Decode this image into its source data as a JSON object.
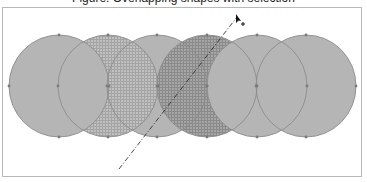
{
  "title": {
    "text": "Figure: Overlapping shapes with selection",
    "note": "title text is clipped at top edge; only descenders visible"
  },
  "canvas": {
    "frame": {
      "x": 2,
      "y": 7,
      "width": 360,
      "height": 170,
      "border_color": "#b8b8b8"
    },
    "colors": {
      "fill_plain": "#b5b5b5",
      "outline": "#8c8c8c",
      "handle": "#7a7a7a",
      "checker_light_a": "#c2c2c2",
      "checker_light_b": "#a6a6a6",
      "checker_dark_a": "#aaaaaa",
      "checker_dark_b": "#8e8e8e",
      "line": "#333333"
    },
    "circles": [
      {
        "id": "circle-1",
        "cx": 59,
        "cy": 86,
        "rx": 50,
        "ry": 51,
        "fill": "plain"
      },
      {
        "id": "circle-2",
        "cx": 108,
        "cy": 86,
        "rx": 50,
        "ry": 51,
        "fill": "checker-light"
      },
      {
        "id": "circle-3",
        "cx": 157,
        "cy": 86,
        "rx": 50,
        "ry": 51,
        "fill": "plain"
      },
      {
        "id": "circle-4",
        "cx": 207,
        "cy": 86,
        "rx": 50,
        "ry": 51,
        "fill": "checker-dark"
      },
      {
        "id": "circle-5",
        "cx": 257,
        "cy": 86,
        "rx": 50,
        "ry": 51,
        "fill": "plain"
      },
      {
        "id": "circle-6",
        "cx": 306,
        "cy": 86,
        "rx": 50,
        "ry": 51,
        "fill": "plain"
      }
    ],
    "draw_order": [
      "circle-3",
      "circle-2",
      "circle-4",
      "circle-1",
      "circle-5",
      "circle-6"
    ],
    "dash_line": {
      "x1": 119,
      "y1": 169,
      "x2": 237,
      "y2": 17,
      "style": "dash-dot"
    },
    "cursor": {
      "x": 237,
      "y": 15,
      "type": "arrow-with-plus"
    }
  }
}
